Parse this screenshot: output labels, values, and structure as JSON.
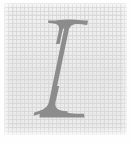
{
  "image": {
    "kind": "letter-specimen",
    "width": 132,
    "height": 143,
    "alt_text": "Italic serif capital letter I"
  },
  "glyph": {
    "character": "I",
    "name": "italic-capital-i",
    "style": "italic",
    "serif": true,
    "color": "#8c8c8c",
    "bounds": {
      "x": 40,
      "y": 19,
      "width": 48,
      "height": 100
    }
  },
  "background": {
    "name": "woven-canvas-texture",
    "base_color": "#ececec",
    "thread_color": "#d8d8d8",
    "panel": {
      "x": 4,
      "y": 3,
      "width": 123,
      "height": 132
    },
    "margin_color": "#fefefe"
  }
}
